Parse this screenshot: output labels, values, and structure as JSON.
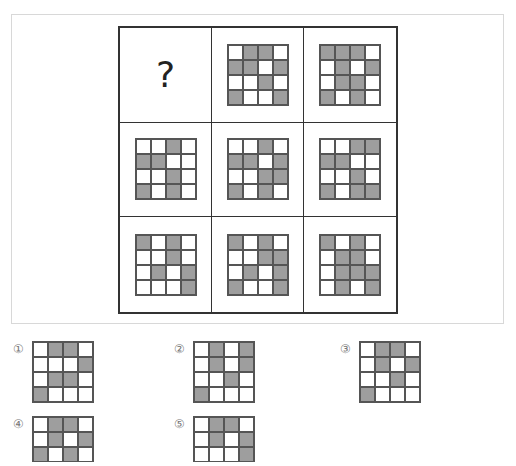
{
  "puzzle": {
    "missing_label": "?",
    "matrix": [
      [
        {
          "type": "question"
        },
        {
          "type": "pattern",
          "grid": [
            [
              0,
              1,
              1,
              0
            ],
            [
              1,
              1,
              0,
              1
            ],
            [
              0,
              0,
              1,
              0
            ],
            [
              1,
              0,
              0,
              1
            ]
          ]
        },
        {
          "type": "pattern",
          "grid": [
            [
              1,
              1,
              1,
              0
            ],
            [
              0,
              1,
              0,
              1
            ],
            [
              0,
              1,
              1,
              0
            ],
            [
              1,
              0,
              1,
              0
            ]
          ]
        }
      ],
      [
        {
          "type": "pattern",
          "grid": [
            [
              0,
              0,
              1,
              0
            ],
            [
              1,
              1,
              0,
              0
            ],
            [
              0,
              0,
              1,
              0
            ],
            [
              1,
              0,
              1,
              0
            ]
          ]
        },
        {
          "type": "pattern",
          "grid": [
            [
              0,
              0,
              1,
              0
            ],
            [
              1,
              1,
              0,
              1
            ],
            [
              0,
              0,
              1,
              1
            ],
            [
              1,
              0,
              1,
              0
            ]
          ]
        },
        {
          "type": "pattern",
          "grid": [
            [
              0,
              0,
              1,
              1
            ],
            [
              1,
              1,
              0,
              0
            ],
            [
              0,
              0,
              1,
              0
            ],
            [
              1,
              0,
              1,
              1
            ]
          ]
        }
      ],
      [
        {
          "type": "pattern",
          "grid": [
            [
              1,
              0,
              1,
              0
            ],
            [
              0,
              0,
              1,
              0
            ],
            [
              0,
              1,
              0,
              1
            ],
            [
              0,
              0,
              0,
              1
            ]
          ]
        },
        {
          "type": "pattern",
          "grid": [
            [
              1,
              0,
              1,
              0
            ],
            [
              0,
              0,
              1,
              1
            ],
            [
              0,
              1,
              0,
              1
            ],
            [
              1,
              0,
              0,
              1
            ]
          ]
        },
        {
          "type": "pattern",
          "grid": [
            [
              1,
              0,
              1,
              0
            ],
            [
              0,
              1,
              1,
              0
            ],
            [
              0,
              1,
              1,
              1
            ],
            [
              0,
              1,
              0,
              1
            ]
          ]
        }
      ]
    ],
    "fill_color": "#9e9e9e"
  },
  "options": [
    {
      "label": "①",
      "grid": [
        [
          0,
          1,
          1,
          0
        ],
        [
          0,
          0,
          0,
          1
        ],
        [
          0,
          1,
          1,
          0
        ],
        [
          1,
          0,
          0,
          0
        ]
      ]
    },
    {
      "label": "②",
      "grid": [
        [
          0,
          1,
          0,
          1
        ],
        [
          0,
          1,
          0,
          1
        ],
        [
          0,
          0,
          1,
          0
        ],
        [
          1,
          0,
          0,
          0
        ]
      ]
    },
    {
      "label": "③",
      "grid": [
        [
          0,
          1,
          1,
          0
        ],
        [
          0,
          1,
          0,
          1
        ],
        [
          0,
          0,
          1,
          0
        ],
        [
          1,
          0,
          0,
          0
        ]
      ]
    },
    {
      "label": "④",
      "grid": [
        [
          0,
          1,
          1,
          0
        ],
        [
          0,
          1,
          0,
          1
        ],
        [
          1,
          0,
          1,
          0
        ]
      ]
    },
    {
      "label": "⑤",
      "grid": [
        [
          0,
          1,
          1,
          0
        ],
        [
          0,
          1,
          0,
          1
        ],
        [
          0,
          0,
          0,
          1
        ]
      ]
    }
  ]
}
